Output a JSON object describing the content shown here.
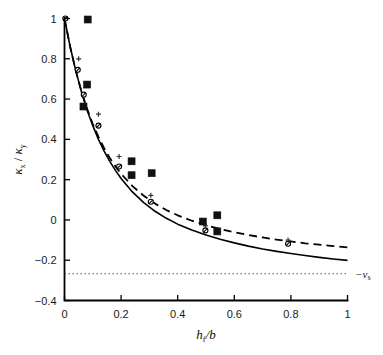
{
  "chart_data": {
    "type": "scatter",
    "title": "",
    "subtitle": "",
    "xlabel": "h_f/b",
    "ylabel": "kappa_x / kappa_y",
    "xlabel_parts": {
      "main": "h",
      "sub": "f",
      "tail": "/b"
    },
    "ylabel_parts": {
      "num_main": "κ",
      "num_sub": "x",
      "slash": " / ",
      "den_main": "κ",
      "den_sub": "y"
    },
    "xlim": [
      0,
      1
    ],
    "ylim": [
      -0.4,
      1.0
    ],
    "xticks": [
      0,
      0.2,
      0.4,
      0.6,
      0.8,
      1
    ],
    "xticklabels": [
      "0",
      "0.2",
      "0.4",
      "0.6",
      "0.8",
      "1"
    ],
    "yticks": [
      -0.4,
      -0.2,
      0,
      0.2,
      0.4,
      0.6,
      0.8,
      1
    ],
    "yticklabels": [
      "-0.4",
      "-0.2",
      "0",
      "0.2",
      "0.4",
      "0.6",
      "0.8",
      "1"
    ],
    "grid": false,
    "legend": "none",
    "axis_style": "box-open-left-bottom",
    "annotations": [
      {
        "name": "poisson-ratio-asymptote-label",
        "text_main": "−ν",
        "text_sub": "s",
        "x": 1.02,
        "y": -0.267,
        "align": "left"
      }
    ],
    "series": [
      {
        "name": "model-solid",
        "type": "line",
        "style": "solid",
        "color": "#000000",
        "width": 1.6,
        "points": [
          [
            0.0,
            1.0
          ],
          [
            0.02,
            0.86
          ],
          [
            0.04,
            0.74
          ],
          [
            0.06,
            0.635
          ],
          [
            0.08,
            0.545
          ],
          [
            0.1,
            0.468
          ],
          [
            0.12,
            0.4
          ],
          [
            0.14,
            0.342
          ],
          [
            0.16,
            0.291
          ],
          [
            0.18,
            0.246
          ],
          [
            0.2,
            0.206
          ],
          [
            0.24,
            0.139
          ],
          [
            0.28,
            0.086
          ],
          [
            0.32,
            0.043
          ],
          [
            0.36,
            0.008
          ],
          [
            0.4,
            -0.021
          ],
          [
            0.45,
            -0.05
          ],
          [
            0.5,
            -0.075
          ],
          [
            0.55,
            -0.096
          ],
          [
            0.6,
            -0.114
          ],
          [
            0.65,
            -0.13
          ],
          [
            0.7,
            -0.144
          ],
          [
            0.75,
            -0.156
          ],
          [
            0.8,
            -0.167
          ],
          [
            0.85,
            -0.177
          ],
          [
            0.9,
            -0.186
          ],
          [
            0.95,
            -0.194
          ],
          [
            1.0,
            -0.201
          ]
        ]
      },
      {
        "name": "model-dashed",
        "type": "line",
        "style": "dashed",
        "color": "#000000",
        "width": 1.8,
        "dasharray": "8,5",
        "points": [
          [
            0.0,
            1.0
          ],
          [
            0.02,
            0.86
          ],
          [
            0.04,
            0.74
          ],
          [
            0.06,
            0.638
          ],
          [
            0.08,
            0.551
          ],
          [
            0.1,
            0.476
          ],
          [
            0.12,
            0.412
          ],
          [
            0.14,
            0.356
          ],
          [
            0.16,
            0.308
          ],
          [
            0.18,
            0.266
          ],
          [
            0.2,
            0.229
          ],
          [
            0.24,
            0.168
          ],
          [
            0.28,
            0.12
          ],
          [
            0.32,
            0.081
          ],
          [
            0.36,
            0.049
          ],
          [
            0.4,
            0.023
          ],
          [
            0.45,
            -0.004
          ],
          [
            0.5,
            -0.026
          ],
          [
            0.55,
            -0.045
          ],
          [
            0.6,
            -0.061
          ],
          [
            0.65,
            -0.075
          ],
          [
            0.7,
            -0.087
          ],
          [
            0.75,
            -0.098
          ],
          [
            0.8,
            -0.107
          ],
          [
            0.85,
            -0.116
          ],
          [
            0.9,
            -0.123
          ],
          [
            0.95,
            -0.13
          ],
          [
            1.0,
            -0.136
          ]
        ]
      },
      {
        "name": "poisson-asymptote",
        "type": "line",
        "style": "dotted",
        "color": "#555555",
        "width": 1.0,
        "dasharray": "1.5,2.5",
        "points": [
          [
            0.0,
            -0.267
          ],
          [
            1.0,
            -0.267
          ]
        ]
      },
      {
        "name": "circle-slash-data",
        "type": "scatter",
        "marker": "circle-slash",
        "color": "#000000",
        "size": 5.0,
        "points": [
          [
            0.003,
            1.0
          ],
          [
            0.047,
            0.745
          ],
          [
            0.068,
            0.622
          ],
          [
            0.12,
            0.468
          ],
          [
            0.193,
            0.265
          ],
          [
            0.305,
            0.09
          ],
          [
            0.498,
            -0.052
          ],
          [
            0.79,
            -0.118
          ]
        ]
      },
      {
        "name": "plus-data",
        "type": "scatter",
        "marker": "plus",
        "color": "#333333",
        "size": 5.0,
        "points": [
          [
            0.05,
            0.8
          ],
          [
            0.12,
            0.525
          ],
          [
            0.193,
            0.315
          ],
          [
            0.305,
            0.122
          ],
          [
            0.498,
            -0.03
          ],
          [
            0.79,
            -0.1
          ]
        ]
      },
      {
        "name": "filled-square-data",
        "type": "scatter",
        "marker": "square",
        "color": "#111111",
        "size": 7.0,
        "points": [
          [
            0.082,
            0.995
          ],
          [
            0.08,
            0.672
          ],
          [
            0.067,
            0.563
          ],
          [
            0.237,
            0.291
          ],
          [
            0.237,
            0.222
          ],
          [
            0.308,
            0.232
          ],
          [
            0.489,
            -0.008
          ],
          [
            0.54,
            0.023
          ],
          [
            0.54,
            -0.057
          ]
        ]
      }
    ]
  }
}
